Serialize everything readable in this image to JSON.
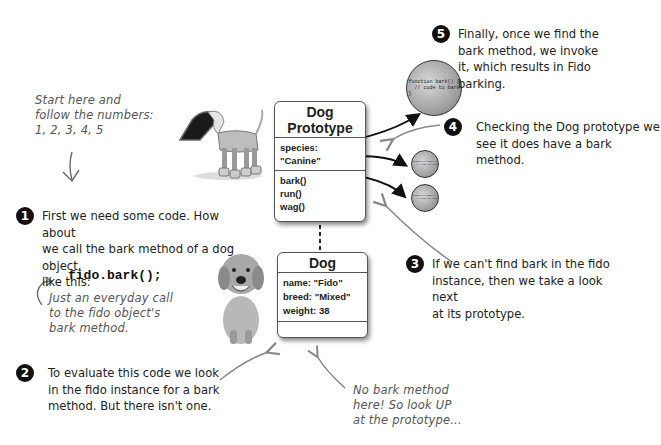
{
  "intro_note": {
    "lines": [
      "Start here and",
      "follow the numbers:",
      "1, 2, 3, 4, 5"
    ]
  },
  "steps": [
    {
      "number": "1",
      "lines": [
        "First we need some code. How about",
        "we call the bark method of a dog object,",
        "like this:"
      ]
    },
    {
      "number": "2",
      "lines": [
        "To evaluate this code we look",
        "in the fido instance for a bark",
        "method. But there isn't one."
      ]
    },
    {
      "number": "3",
      "lines": [
        "If we can't find bark in the fido",
        "instance, then we take a look next",
        "at its prototype."
      ]
    },
    {
      "number": "4",
      "lines": [
        "Checking the Dog prototype we",
        "see it does have a bark method."
      ]
    },
    {
      "number": "5",
      "lines": [
        "Finally, once we find the",
        "bark method, we invoke",
        "it, which results in Fido",
        "barking."
      ]
    }
  ],
  "code_sample": "fido.bark();",
  "code_note": {
    "lines": [
      "Just an everyday call",
      "to the fido object's",
      "bark method."
    ]
  },
  "lookup_note": {
    "lines": [
      "No bark method",
      "here! So look UP",
      "at the prototype..."
    ]
  },
  "prototype_box": {
    "title": "Dog Prototype",
    "properties": [
      "species: \"Canine\""
    ],
    "methods": [
      "bark()",
      "run()",
      "wag()"
    ]
  },
  "instance_box": {
    "title": "Dog",
    "properties": [
      "name: \"Fido\"",
      "breed: \"Mixed\"",
      "weight: 38"
    ]
  },
  "function_circles": {
    "bark": "function bark() {\n  // code to bark\n}",
    "run": "function run() {\n  // code to run\n}",
    "wag": "function wag() {\n  // code to wag\n}"
  },
  "images": {
    "robot_dog": "robot-dog-illustration",
    "real_dog": "golden-retriever-photo"
  }
}
